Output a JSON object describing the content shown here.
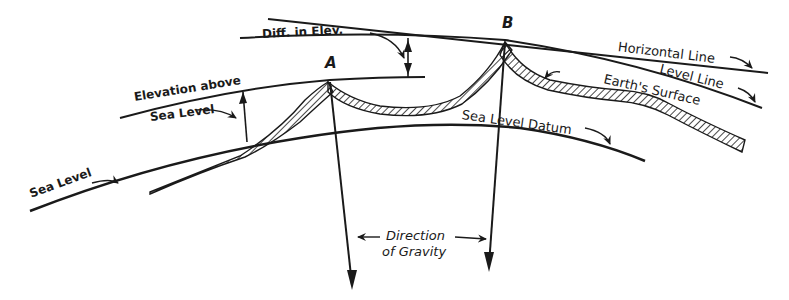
{
  "diagram": {
    "points": {
      "a": "A",
      "b": "B"
    },
    "labels": {
      "diff_in_elev": "Diff. in Elev.",
      "horizontal_line": "Horizontal Line",
      "level_line": "Level Line",
      "earths_surface": "Earth's Surface",
      "elevation_above_line1": "Elevation above",
      "elevation_above_line2": "Sea Level",
      "sea_level_datum": "Sea Level Datum",
      "sea_level": "Sea Level",
      "direction_line1": "Direction",
      "direction_line2": "of Gravity"
    },
    "colors": {
      "ink": "#1a1a1a",
      "paper": "#ffffff"
    }
  }
}
